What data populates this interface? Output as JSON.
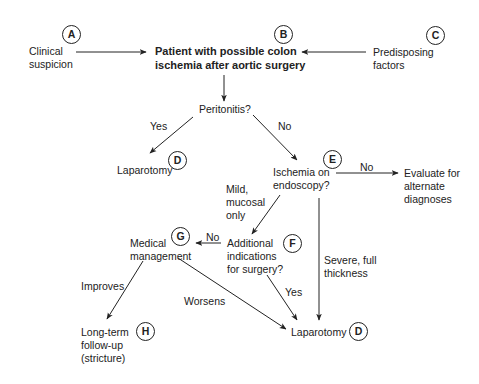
{
  "nodes": {
    "clinical": {
      "line1": "Clinical",
      "line2": "suspicion",
      "marker": "A"
    },
    "patient": {
      "line1": "Patient with possible colon",
      "line2": "ischemia after aortic surgery",
      "marker": "B"
    },
    "predisposing": {
      "line1": "Predisposing",
      "line2": "factors",
      "marker": "C"
    },
    "peritonitis": {
      "line1": "Peritonitis?"
    },
    "laparotomy_top": {
      "line1": "Laparotomy",
      "marker": "D"
    },
    "ischemia": {
      "line1": "Ischemia on",
      "line2": "endoscopy?",
      "marker": "E"
    },
    "evaluate": {
      "line1": "Evaluate for",
      "line2": "alternate",
      "line3": "diagnoses"
    },
    "additional": {
      "line1": "Additional",
      "line2": "indications",
      "line3": "for surgery?",
      "marker": "F"
    },
    "medical": {
      "line1": "Medical",
      "line2": "management",
      "marker": "G"
    },
    "longterm": {
      "line1": "Long-term",
      "line2": "follow-up",
      "line3": "(stricture)",
      "marker": "H"
    },
    "laparotomy_bottom": {
      "line1": "Laparotomy",
      "marker": "D"
    }
  },
  "edge_labels": {
    "yes_peritonitis": "Yes",
    "no_peritonitis": "No",
    "no_ischemia": "No",
    "mild_line1": "Mild,",
    "mild_line2": "mucosal",
    "mild_line3": "only",
    "no_additional": "No",
    "yes_additional": "Yes",
    "severe_line1": "Severe, full",
    "severe_line2": "thickness",
    "improves": "Improves",
    "worsens": "Worsens"
  }
}
